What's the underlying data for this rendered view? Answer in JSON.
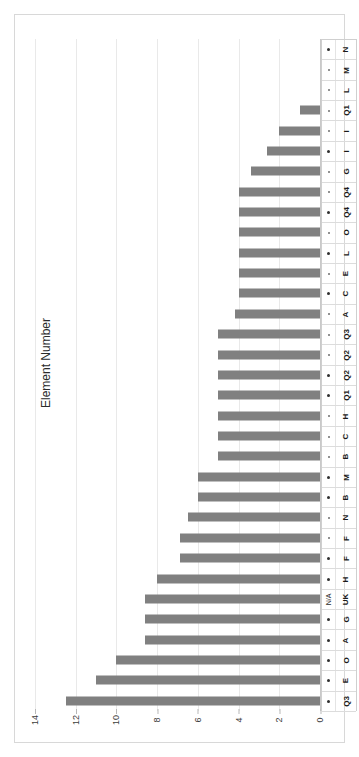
{
  "chart_data": {
    "type": "bar",
    "orientation": "horizontal",
    "title": "",
    "xlabel": "",
    "ylabel": "Element Number",
    "xlim": [
      0,
      14
    ],
    "x_ticks": [
      14,
      12,
      10,
      8,
      6,
      4,
      2,
      0
    ],
    "x_axis_reversed": true,
    "grid": true,
    "legend": null,
    "bar_color": "#808080",
    "gridline_color": "#e9e9e9",
    "background_color": "#ffffff",
    "categories": [
      "N",
      "M",
      "L",
      "Q1",
      "I",
      "I",
      "G",
      "Q4",
      "Q4",
      "O",
      "L",
      "E",
      "C",
      "A",
      "Q3",
      "Q2",
      "Q2",
      "Q1",
      "H",
      "C",
      "B",
      "M",
      "B",
      "N",
      "F",
      "F",
      "H",
      "UK",
      "G",
      "A",
      "O",
      "E",
      "Q3"
    ],
    "values": [
      0,
      0,
      0,
      1,
      2,
      2.6,
      3.4,
      4,
      4,
      4,
      4,
      4,
      4,
      4.2,
      5,
      5,
      5,
      5,
      5,
      5,
      5,
      6,
      6,
      6.5,
      6.9,
      6.9,
      8,
      8.6,
      8.6,
      8.6,
      10,
      11,
      12.5
    ],
    "markers": [
      "bold",
      "dot",
      "dot",
      "dot",
      "dot",
      "bold",
      "dot",
      "dot",
      "bold",
      "dot",
      "bold",
      "dot",
      "bold",
      "dot",
      "dot",
      "dot",
      "bold",
      "bold",
      "dot",
      "dot",
      "dot",
      "bold",
      "bold",
      "dot",
      "dot",
      "bold",
      "bold",
      "N/A",
      "bold",
      "bold",
      "bold",
      "bold",
      "bold"
    ]
  },
  "axis": {
    "y_title": "Element Number",
    "tick_labels": [
      "14",
      "12",
      "10",
      "8",
      "6",
      "4",
      "2",
      "0"
    ]
  },
  "marker_na_label": "N/A"
}
